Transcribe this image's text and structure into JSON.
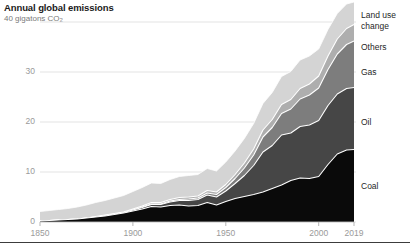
{
  "chart_data": {
    "type": "area",
    "stacked": true,
    "title": "Annual global emissions",
    "subtitle": "40 gigatons CO2",
    "subtitle_prefix": "40 gigatons CO",
    "subtitle_subscript": "2",
    "xlabel": "",
    "ylabel": "",
    "xlim": [
      1850,
      2019
    ],
    "ylim": [
      0,
      40
    ],
    "grid": true,
    "legend_position": "right-inline",
    "xticks": [
      1850,
      1900,
      1950,
      2000,
      2019
    ],
    "xtick_labels": [
      "1850",
      "1900",
      "1950",
      "2000",
      "2019"
    ],
    "yticks": [
      0,
      10,
      20,
      30,
      40
    ],
    "ytick_labels": [
      "0",
      "10",
      "20",
      "30",
      "40"
    ],
    "ytick_labels_shown": [
      "0",
      "10",
      "20",
      "30"
    ],
    "units": "gigatons CO2 per year",
    "colors": {
      "coal": "#0a0a0a",
      "oil": "#464646",
      "gas": "#7d7d7d",
      "others": "#aeaeae",
      "land_use_change": "#d4d4d4",
      "separator": "#ffffff",
      "gridline": "#e3e3e3",
      "axis_text": "#9a9a9a",
      "title_text": "#1a1a1a",
      "subtitle_text": "#7a7a7a",
      "rule": "#3c3c3c"
    },
    "x": [
      1850,
      1855,
      1860,
      1865,
      1870,
      1875,
      1880,
      1885,
      1890,
      1895,
      1900,
      1905,
      1910,
      1915,
      1920,
      1925,
      1930,
      1935,
      1940,
      1945,
      1950,
      1955,
      1960,
      1965,
      1970,
      1975,
      1980,
      1985,
      1990,
      1995,
      2000,
      2005,
      2010,
      2015,
      2019
    ],
    "series": [
      {
        "name": "Coal",
        "label": "Coal",
        "color": "#0a0a0a",
        "values": [
          0.2,
          0.3,
          0.4,
          0.5,
          0.6,
          0.8,
          1.0,
          1.2,
          1.5,
          1.8,
          2.2,
          2.6,
          3.1,
          3.0,
          3.3,
          3.4,
          3.2,
          3.3,
          3.9,
          3.4,
          4.1,
          4.7,
          5.1,
          5.5,
          6.0,
          6.7,
          7.4,
          8.3,
          8.8,
          8.7,
          9.1,
          11.5,
          13.6,
          14.4,
          14.5
        ]
      },
      {
        "name": "Oil",
        "label": "Oil",
        "color": "#464646",
        "values": [
          0.0,
          0.0,
          0.0,
          0.0,
          0.0,
          0.0,
          0.0,
          0.1,
          0.1,
          0.1,
          0.2,
          0.3,
          0.4,
          0.5,
          0.7,
          0.9,
          1.1,
          1.2,
          1.5,
          1.6,
          2.1,
          3.0,
          4.2,
          5.8,
          8.0,
          8.6,
          10.0,
          9.5,
          10.3,
          10.7,
          11.2,
          11.8,
          12.0,
          12.3,
          12.4
        ]
      },
      {
        "name": "Gas",
        "label": "Gas",
        "color": "#7d7d7d",
        "values": [
          0.0,
          0.0,
          0.0,
          0.0,
          0.0,
          0.0,
          0.0,
          0.0,
          0.0,
          0.0,
          0.0,
          0.1,
          0.1,
          0.1,
          0.2,
          0.2,
          0.3,
          0.3,
          0.4,
          0.5,
          0.7,
          1.0,
          1.5,
          2.1,
          3.0,
          3.6,
          4.3,
          4.8,
          5.5,
          6.0,
          6.5,
          7.2,
          8.0,
          8.8,
          9.3
        ]
      },
      {
        "name": "Others",
        "label": "Others",
        "color": "#aeaeae",
        "values": [
          0.0,
          0.0,
          0.0,
          0.0,
          0.0,
          0.0,
          0.1,
          0.1,
          0.1,
          0.1,
          0.2,
          0.2,
          0.3,
          0.3,
          0.3,
          0.4,
          0.4,
          0.4,
          0.5,
          0.5,
          0.6,
          0.8,
          1.0,
          1.2,
          1.4,
          1.6,
          1.8,
          1.9,
          2.1,
          2.2,
          2.4,
          2.7,
          3.0,
          3.2,
          3.3
        ]
      },
      {
        "name": "Land use change",
        "label": "Land use change",
        "color": "#d4d4d4",
        "values": [
          1.9,
          2.0,
          2.1,
          2.2,
          2.4,
          2.6,
          2.8,
          2.9,
          3.1,
          3.3,
          3.5,
          3.7,
          3.9,
          3.8,
          4.0,
          4.2,
          4.3,
          4.3,
          4.4,
          4.2,
          4.5,
          4.7,
          4.9,
          5.1,
          5.3,
          5.4,
          5.6,
          5.6,
          5.7,
          5.6,
          5.4,
          5.3,
          5.1,
          4.9,
          4.5
        ]
      }
    ],
    "annotations": []
  },
  "legend_labels": {
    "land_use_change_line1": "Land use",
    "land_use_change_line2": "change",
    "others": "Others",
    "gas": "Gas",
    "oil": "Oil",
    "coal": "Coal"
  }
}
